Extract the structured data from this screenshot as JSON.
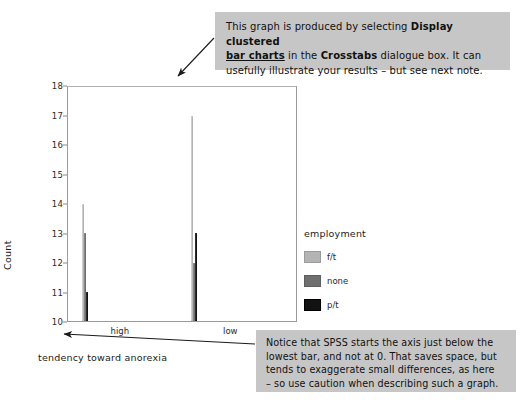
{
  "chart_data": {
    "type": "bar",
    "title": "",
    "subtitle": "",
    "xlabel": "tendency toward anorexia",
    "ylabel": "Count",
    "categories": [
      "high",
      "low"
    ],
    "series": [
      {
        "name": "f/t",
        "values": [
          14,
          17
        ],
        "color": "#b4b4b4"
      },
      {
        "name": "none",
        "values": [
          13,
          12
        ],
        "color": "#6f6f6f"
      },
      {
        "name": "p/t",
        "values": [
          11,
          13
        ],
        "color": "#121212"
      }
    ],
    "ylim": [
      10,
      18
    ],
    "yticks": [
      10,
      11,
      12,
      13,
      14,
      15,
      16,
      17,
      18
    ],
    "ytick_labels": [
      "10",
      "11",
      "12",
      "13",
      "14",
      "15",
      "16",
      "17",
      "18"
    ],
    "grid": false,
    "legend_title": "employment",
    "legend_position": "right",
    "grouping": "clustered"
  },
  "legend": {
    "title": "employment",
    "entries": [
      {
        "label": "f/t"
      },
      {
        "label": "none"
      },
      {
        "label": "p/t"
      }
    ]
  },
  "axes": {
    "y_title": "Count",
    "x_title": "tendency toward anorexia"
  },
  "notes": {
    "top": {
      "line1_a": "This graph is produced by selecting ",
      "line1_b": "Display clustered",
      "line2_a": "bar charts",
      "line2_b": " in the ",
      "line2_c": "Crosstabs",
      "line2_d": " dialogue box. It can",
      "line3": "usefully illustrate your results – but see next note."
    },
    "bottom": {
      "line1": "Notice that SPSS starts the axis just below the",
      "line2": "lowest bar, and not at 0. That saves space, but",
      "line3": "tends to exaggerate small differences, as here",
      "line4": "– so use caution when describing such a graph."
    }
  }
}
